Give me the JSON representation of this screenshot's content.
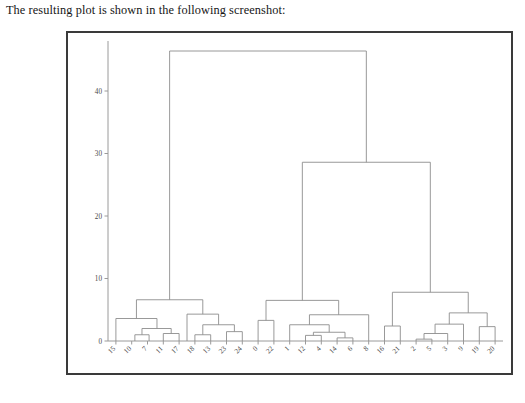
{
  "page": {
    "caption": "The resulting plot is shown in the following screenshot:"
  },
  "chart_data": {
    "type": "dendrogram",
    "title": "",
    "xlabel": "",
    "ylabel": "",
    "ylim": [
      0,
      48
    ],
    "yticks": [
      0,
      10,
      20,
      30,
      40
    ],
    "ytick_labels": [
      "0",
      "10",
      "20",
      "30",
      "40"
    ],
    "grid": false,
    "legend_position": "none",
    "leaf_count": 25,
    "leaf_labels": [
      "15",
      "10",
      "7",
      "11",
      "17",
      "18",
      "13",
      "23",
      "24",
      "0",
      "22",
      "1",
      "12",
      "4",
      "14",
      "6",
      "8",
      "16",
      "21",
      "2",
      "5",
      "3",
      "9",
      "19",
      "20"
    ],
    "leaf_rotation": 45,
    "link_color": "#8d8d8d",
    "frame_color": "#3a3a3a",
    "axis_color": "#9a9a9a",
    "linkages": [
      {
        "id": "L1",
        "left_x": 1.2,
        "right_x": 2.1,
        "left_h": 0.0,
        "right_h": 0.0,
        "height": 1.0
      },
      {
        "id": "L2",
        "left_x": 3.0,
        "right_x": 4.0,
        "left_h": 0.0,
        "right_h": 0.0,
        "height": 1.2
      },
      {
        "id": "L3",
        "left_x": 1.65,
        "right_x": 3.5,
        "left_h": 1.0,
        "right_h": 1.2,
        "height": 2.0
      },
      {
        "id": "L4",
        "left_x": 0.0,
        "right_x": 2.6,
        "left_h": 0.0,
        "right_h": 2.0,
        "height": 3.6
      },
      {
        "id": "L5",
        "left_x": 5.0,
        "right_x": 6.0,
        "left_h": 0.0,
        "right_h": 0.0,
        "height": 1.0
      },
      {
        "id": "L6",
        "left_x": 7.0,
        "right_x": 8.0,
        "left_h": 0.0,
        "right_h": 0.0,
        "height": 1.5
      },
      {
        "id": "L7",
        "left_x": 5.5,
        "right_x": 7.5,
        "left_h": 1.0,
        "right_h": 1.5,
        "height": 2.6
      },
      {
        "id": "L8",
        "left_x": 4.5,
        "right_x": 6.5,
        "left_h": 0.0,
        "right_h": 2.6,
        "height": 4.3
      },
      {
        "id": "L9",
        "left_x": 1.3,
        "right_x": 5.5,
        "left_h": 3.6,
        "right_h": 4.3,
        "height": 6.6
      },
      {
        "id": "L10",
        "left_x": 9.0,
        "right_x": 10.0,
        "left_h": 0.0,
        "right_h": 0.0,
        "height": 3.3
      },
      {
        "id": "L11",
        "left_x": 12.0,
        "right_x": 13.0,
        "left_h": 0.0,
        "right_h": 0.0,
        "height": 0.9
      },
      {
        "id": "L12",
        "left_x": 14.0,
        "right_x": 15.0,
        "left_h": 0.0,
        "right_h": 0.0,
        "height": 0.5
      },
      {
        "id": "L13",
        "left_x": 12.5,
        "right_x": 14.5,
        "left_h": 0.9,
        "right_h": 0.5,
        "height": 1.4
      },
      {
        "id": "L14",
        "left_x": 11.0,
        "right_x": 13.5,
        "left_h": 0.0,
        "right_h": 1.4,
        "height": 2.6
      },
      {
        "id": "L15",
        "left_x": 16.0,
        "right_x": 12.25,
        "left_h": 0.0,
        "right_h": 2.6,
        "height": 4.2
      },
      {
        "id": "L16",
        "left_x": 9.5,
        "right_x": 14.1,
        "left_h": 3.3,
        "right_h": 4.2,
        "height": 6.5
      },
      {
        "id": "L17",
        "left_x": 17.0,
        "right_x": 18.0,
        "left_h": 0.0,
        "right_h": 0.0,
        "height": 2.4
      },
      {
        "id": "L18",
        "left_x": 19.0,
        "right_x": 20.0,
        "left_h": 0.0,
        "right_h": 0.0,
        "height": 0.3
      },
      {
        "id": "L19",
        "left_x": 21.0,
        "right_x": 19.5,
        "left_h": 0.0,
        "right_h": 0.3,
        "height": 1.2
      },
      {
        "id": "L20",
        "left_x": 20.2,
        "right_x": 22.0,
        "left_h": 1.2,
        "right_h": 0.0,
        "height": 2.7
      },
      {
        "id": "L21",
        "left_x": 23.0,
        "right_x": 24.0,
        "left_h": 0.0,
        "right_h": 0.0,
        "height": 2.3
      },
      {
        "id": "L22",
        "left_x": 21.1,
        "right_x": 23.5,
        "left_h": 2.7,
        "right_h": 2.3,
        "height": 4.5
      },
      {
        "id": "L23",
        "left_x": 17.5,
        "right_x": 22.3,
        "left_h": 2.4,
        "right_h": 4.5,
        "height": 7.8
      },
      {
        "id": "L24",
        "left_x": 11.8,
        "right_x": 19.9,
        "left_h": 6.5,
        "right_h": 7.8,
        "height": 28.6
      },
      {
        "id": "L25",
        "left_x": 3.4,
        "right_x": 15.85,
        "left_h": 6.6,
        "right_h": 28.6,
        "height": 46.4
      }
    ]
  }
}
